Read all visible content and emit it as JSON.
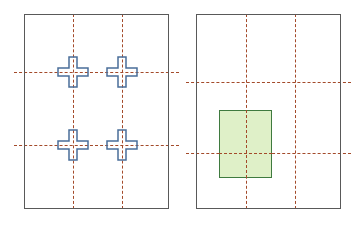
{
  "figure": {
    "title": "",
    "background_color": "#ffffff",
    "width": 336,
    "height": 228
  },
  "colors": {
    "panel_border": "#595959",
    "grid_dash": "#a34a2a",
    "cross_stroke": "#4a6e99",
    "rect_fill": "#dff0c8",
    "rect_stroke": "#3f7a3f"
  },
  "panels": [
    {
      "id": "left-panel",
      "name": "left-diagram-panel",
      "frame": {
        "x": 24,
        "y": 14,
        "width": 145,
        "height": 195
      },
      "grid": {
        "vertical_lines_x": [
          73,
          122
        ],
        "horizontal_lines_y": [
          72,
          145
        ],
        "style": "dashed",
        "color": "#a34a2a"
      },
      "markers": {
        "type": "cross-outline",
        "count": 4,
        "color": "#4a6e99",
        "positions": [
          {
            "x": 73,
            "y": 72
          },
          {
            "x": 122,
            "y": 72
          },
          {
            "x": 73,
            "y": 145
          },
          {
            "x": 122,
            "y": 145
          }
        ]
      }
    },
    {
      "id": "right-panel",
      "name": "right-diagram-panel",
      "frame": {
        "x": 196,
        "y": 14,
        "width": 145,
        "height": 195
      },
      "grid": {
        "vertical_lines_x": [
          246,
          295
        ],
        "horizontal_lines_y": [
          82,
          153
        ],
        "style": "dashed",
        "color": "#a34a2a"
      },
      "shape": {
        "type": "rectangle",
        "name": "highlighted-region",
        "fill": "#dff0c8",
        "stroke": "#3f7a3f",
        "bounds": {
          "x": 219,
          "y": 110,
          "width": 53,
          "height": 68
        }
      }
    }
  ],
  "labels": {
    "left_panel_label": "",
    "right_panel_label": "",
    "caption": ""
  }
}
